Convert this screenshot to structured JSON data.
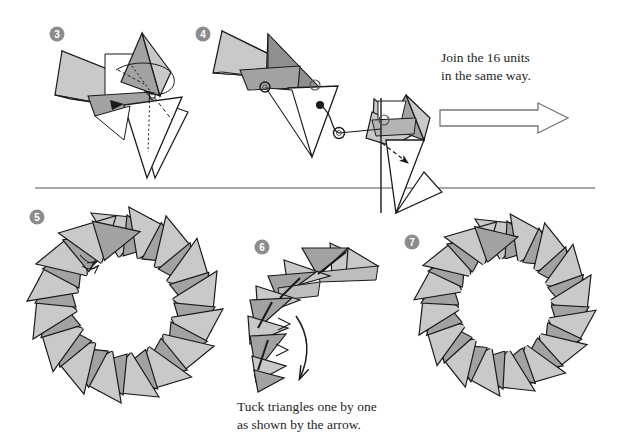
{
  "page": {
    "width": 622,
    "height": 448,
    "background": "#ffffff"
  },
  "colors": {
    "paper_light": "#c9c9c9",
    "paper_dark": "#a2a2a2",
    "paper_white": "#ffffff",
    "outline": "#1a1a1a",
    "badge_fill": "#8c8c8c",
    "badge_text": "#ffffff",
    "divider": "#555555",
    "text": "#262626"
  },
  "steps": [
    {
      "id": "3",
      "label": "3",
      "badge_x": 57,
      "badge_y": 34,
      "name": "step-3-unit-pair"
    },
    {
      "id": "4",
      "label": "4",
      "badge_x": 203,
      "badge_y": 34,
      "name": "step-4-joining-units"
    },
    {
      "id": "5",
      "label": "5",
      "badge_x": 37,
      "badge_y": 217,
      "name": "step-5-ring-of-16"
    },
    {
      "id": "6",
      "label": "6",
      "badge_x": 262,
      "badge_y": 247,
      "name": "step-6-tuck-detail"
    },
    {
      "id": "7",
      "label": "7",
      "badge_x": 412,
      "badge_y": 242,
      "name": "step-7-finished-wreath"
    }
  ],
  "captions": {
    "join": "Join the 16 units\nin the same way.",
    "join_line1": "Join the 16 units",
    "join_line2": "in the same way.",
    "tuck": "Tuck triangles one by one\nas shown by the arrow.",
    "tuck_line1": "Tuck triangles one by one",
    "tuck_line2": "as shown by the arrow."
  },
  "arrows": {
    "big_right": {
      "name": "big-right-arrow",
      "x": 440,
      "y": 103,
      "width": 128,
      "height": 30
    },
    "step6_curve": {
      "name": "tuck-direction-arrow"
    },
    "step4_dashed": {
      "name": "insert-dashed-arrow"
    },
    "step3_curve": {
      "name": "fold-curve-arrow"
    }
  },
  "divider": {
    "name": "section-divider",
    "x1": 35,
    "y1": 188,
    "x2": 595,
    "y2": 188
  },
  "rings": {
    "step5": {
      "units": 16,
      "outer_radius": 92,
      "inner_radius": 50,
      "cx": 125,
      "cy": 305
    },
    "step7": {
      "units": 16,
      "outer_radius": 86,
      "inner_radius": 48,
      "cx": 505,
      "cy": 305
    }
  },
  "unit_counts": {
    "total_units": 16
  }
}
